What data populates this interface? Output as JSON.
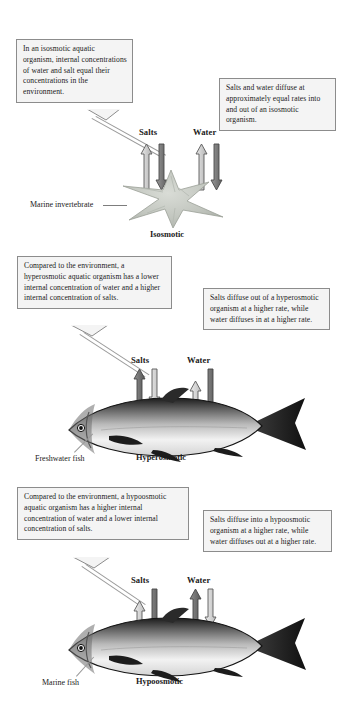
{
  "figure": {
    "panels": [
      {
        "id": "isosmotic",
        "state_label": "Isosmotic",
        "organism_label": "Marine invertebrate",
        "organism_icon": "starfish-illustration",
        "left_callout": "In an isosmotic aquatic organism, internal concentrations of water and salt equal their concentrations in the environment.",
        "right_callout": "Salts and water diffuse at approximately equal rates into and out of an isosmotic organism.",
        "arrows": [
          {
            "label": "Salts",
            "up": {
              "length": "medium",
              "shade": "light",
              "direction": "up"
            },
            "down": {
              "length": "medium",
              "shade": "dark",
              "direction": "down"
            }
          },
          {
            "label": "Water",
            "up": {
              "length": "medium",
              "shade": "light",
              "direction": "up"
            },
            "down": {
              "length": "medium",
              "shade": "dark",
              "direction": "down"
            }
          }
        ]
      },
      {
        "id": "hyperosmotic",
        "state_label": "Hyperosmotic",
        "organism_label": "Freshwater fish",
        "organism_icon": "fish-illustration",
        "left_callout": "Compared to the environment, a hyperosmotic aquatic organism has a lower internal concentration of water and a higher internal concentration of salts.",
        "right_callout": "Salts diffuse out of a hyperosmotic organism at a higher rate, while water diffuses in at a higher rate.",
        "arrows": [
          {
            "label": "Salts",
            "up": {
              "length": "long",
              "shade": "dark",
              "direction": "up"
            },
            "down": {
              "length": "short",
              "shade": "light",
              "direction": "down"
            }
          },
          {
            "label": "Water",
            "up": {
              "length": "short",
              "shade": "light",
              "direction": "up"
            },
            "down": {
              "length": "long",
              "shade": "dark",
              "direction": "down"
            }
          }
        ]
      },
      {
        "id": "hypoosmotic",
        "state_label": "Hypoosmotic",
        "organism_label": "Marine fish",
        "organism_icon": "fish-illustration",
        "left_callout": "Compared to the environment, a hypoosmotic aquatic organism has a higher internal concentration of water and a lower internal concentration of salts.",
        "right_callout": "Salts diffuse into a hypoosmotic organism at a higher rate, while water diffuses out at a higher rate.",
        "arrows": [
          {
            "label": "Salts",
            "up": {
              "length": "short",
              "shade": "light",
              "direction": "up"
            },
            "down": {
              "length": "long",
              "shade": "dark",
              "direction": "down"
            }
          },
          {
            "label": "Water",
            "up": {
              "length": "long",
              "shade": "dark",
              "direction": "up"
            },
            "down": {
              "length": "short",
              "shade": "light",
              "direction": "down"
            }
          }
        ]
      }
    ]
  },
  "colors": {
    "background": "#ffffff",
    "callout_fill": "#f4f4f4",
    "callout_border": "#8c8c8c",
    "text": "#1a1a1a",
    "arrow_dark": "#6f6f6f",
    "arrow_light": "#d8d8d8",
    "arrow_outline": "#5a5a5a",
    "leader_line": "#9a9a9a"
  }
}
